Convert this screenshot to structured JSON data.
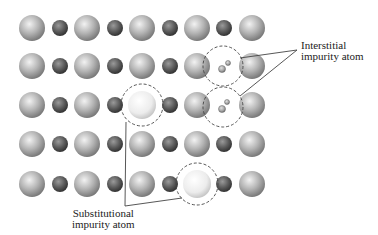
{
  "diagram": {
    "labels": {
      "interstitial": {
        "line1": "Interstitial",
        "line2": "impurity atom"
      },
      "substitutional": {
        "line1": "Substitutional",
        "line2": "impurity atom"
      }
    },
    "lattice": {
      "rows_y": [
        28,
        66,
        105,
        144,
        184
      ],
      "cols_x": [
        32,
        60,
        87,
        115,
        142,
        170,
        197,
        224,
        252
      ],
      "host_atom_radius": 13,
      "small_atom_radius": 8,
      "substitutions": [
        {
          "row": 2,
          "col": 4
        },
        {
          "row": 4,
          "col": 6
        }
      ],
      "interstitial_sites": [
        {
          "row": 1,
          "col": 7
        },
        {
          "row": 2,
          "col": 7
        }
      ]
    },
    "colors": {
      "host_atom": "#a8a8a8",
      "small_atom": "#555555",
      "impurity_atom": "#e8e8e8",
      "outline": "#444444"
    }
  }
}
